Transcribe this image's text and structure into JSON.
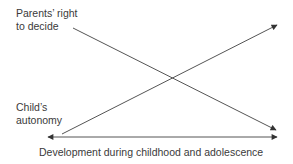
{
  "diagram": {
    "labels": {
      "parents_line1": "Parents’ right",
      "parents_line2": "to decide",
      "child_line1": "Child’s",
      "child_line2": "autonomy",
      "x_axis": "Development during childhood and adolescence"
    },
    "lines": [
      {
        "name": "parents-right-line",
        "from": [
          73,
          28
        ],
        "to": [
          276,
          130
        ],
        "direction": "decreasing"
      },
      {
        "name": "child-autonomy-line",
        "from": [
          62,
          134
        ],
        "to": [
          277,
          25
        ],
        "direction": "increasing"
      },
      {
        "name": "development-axis",
        "from": [
          48,
          137
        ],
        "to": [
          277,
          137
        ],
        "double_headed": true
      }
    ],
    "line_color": "#555555"
  }
}
